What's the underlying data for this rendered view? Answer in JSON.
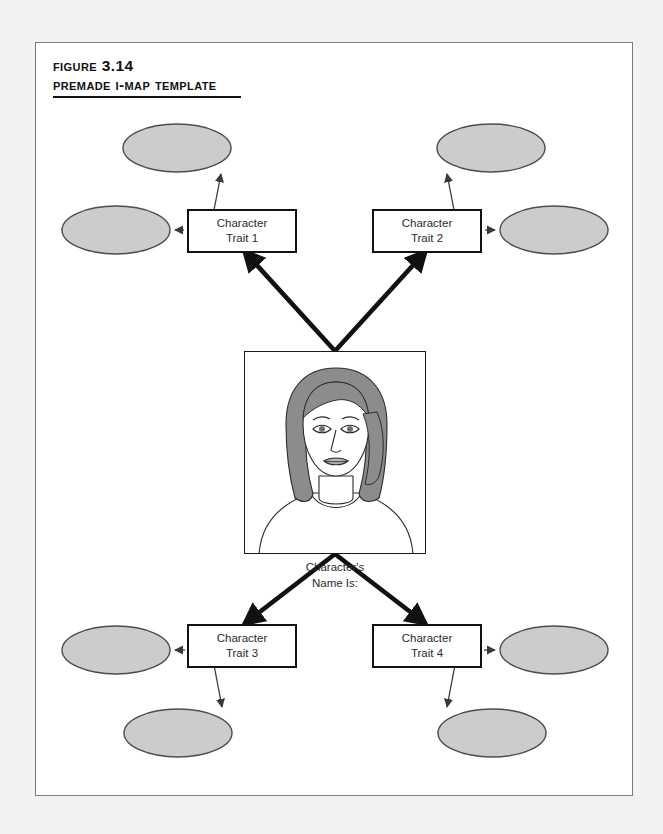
{
  "figure": {
    "label": "Figure 3.14",
    "title": "Premade I-Map Template"
  },
  "center": {
    "portrait_alt": "character-portrait",
    "caption_line1": "Character's",
    "caption_line2": "Name Is:"
  },
  "traits": [
    {
      "id": "trait-1",
      "line1": "Character",
      "line2": "Trait 1"
    },
    {
      "id": "trait-2",
      "line1": "Character",
      "line2": "Trait 2"
    },
    {
      "id": "trait-3",
      "line1": "Character",
      "line2": "Trait 3"
    },
    {
      "id": "trait-4",
      "line1": "Character",
      "line2": "Trait 4"
    }
  ],
  "detail_ovals": [
    {
      "id": "oval-trait1-a",
      "label": ""
    },
    {
      "id": "oval-trait1-b",
      "label": ""
    },
    {
      "id": "oval-trait2-a",
      "label": ""
    },
    {
      "id": "oval-trait2-b",
      "label": ""
    },
    {
      "id": "oval-trait3-a",
      "label": ""
    },
    {
      "id": "oval-trait3-b",
      "label": ""
    },
    {
      "id": "oval-trait4-a",
      "label": ""
    },
    {
      "id": "oval-trait4-b",
      "label": ""
    }
  ],
  "colors": {
    "page_background": "#f2f2f1",
    "card_background": "#ffffff",
    "card_border": "#7b7b7b",
    "oval_fill": "#cccccc",
    "oval_stroke": "#4d4d4d",
    "box_stroke": "#111111",
    "thick_connector": "#111111",
    "thin_connector": "#3a3a3a",
    "hair_shade": "#8c8c8c",
    "text": "#2b2b2b"
  }
}
